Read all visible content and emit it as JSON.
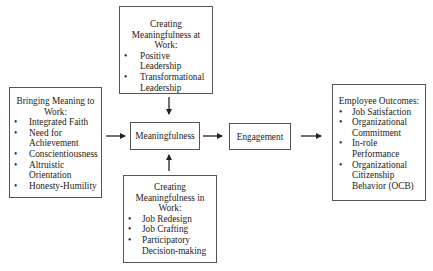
{
  "diagram": {
    "nodes": {
      "top": {
        "title": "Creating Meaningfulness at Work:",
        "title_lines": [
          "Creating",
          "Meaningfulness at",
          "Work:"
        ],
        "items": [
          "Positive Leadership",
          "Transformational Leadership"
        ],
        "item_lines": [
          [
            "Positive Leadership"
          ],
          [
            "Transformational",
            "Leadership"
          ]
        ]
      },
      "left": {
        "title": "Bringing Meaning to Work:",
        "title_lines": [
          "Bringing Meaning to",
          "Work:"
        ],
        "items": [
          "Integrated Faith",
          "Need for Achievement",
          "Conscientiousness",
          "Altruistic Orientation",
          "Honesty-Humility"
        ],
        "item_lines": [
          [
            "Integrated Faith"
          ],
          [
            "Need for",
            "Achievement"
          ],
          [
            "Conscientiousness"
          ],
          [
            "Altruistic",
            "Orientation"
          ],
          [
            "Honesty-Humility"
          ]
        ]
      },
      "meaningfulness": {
        "label": "Meaningfulness"
      },
      "engagement": {
        "label": "Engagement"
      },
      "bottom": {
        "title": "Creating Meaningfulness in Work:",
        "title_lines": [
          "Creating",
          "Meaningfulness in",
          "Work:"
        ],
        "items": [
          "Job Redesign",
          "Job Crafting",
          "Participatory Decision-making"
        ],
        "item_lines": [
          [
            "Job Redesign"
          ],
          [
            "Job Crafting"
          ],
          [
            "Participatory",
            "Decision-making"
          ]
        ]
      },
      "right": {
        "title": "Employee Outcomes:",
        "title_lines": [
          "Employee Outcomes:"
        ],
        "items": [
          "Job Satisfaction",
          "Organizational Commitment",
          "In-role Performance",
          "Organizational Citizenship Behavior (OCB)"
        ],
        "item_lines": [
          [
            "Job Satisfaction"
          ],
          [
            "Organizational",
            "Commitment"
          ],
          [
            "In-role",
            "Performance"
          ],
          [
            "Organizational",
            "Citizenship",
            "Behavior (OCB)"
          ]
        ]
      }
    },
    "edges": [
      {
        "from": "top",
        "to": "meaningfulness"
      },
      {
        "from": "left",
        "to": "meaningfulness"
      },
      {
        "from": "bottom",
        "to": "meaningfulness"
      },
      {
        "from": "meaningfulness",
        "to": "engagement"
      },
      {
        "from": "engagement",
        "to": "right"
      }
    ],
    "colors": {
      "border": "#555555",
      "arrow": "#222222",
      "text": "#222222",
      "background": "#ffffff"
    }
  }
}
